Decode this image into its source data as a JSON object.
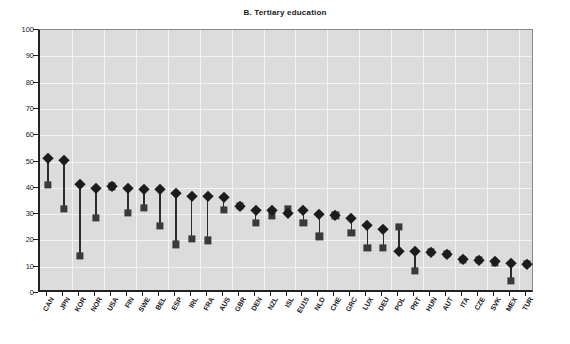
{
  "chart": {
    "title": "B. Tertiary education",
    "type": "dot-plot"
  },
  "chart_data": {
    "type": "scatter",
    "title": "B. Tertiary education",
    "xlabel": "",
    "ylabel": "",
    "ylim": [
      0,
      100
    ],
    "ytick_labels": [
      "0",
      "10",
      "20",
      "30",
      "40",
      "50",
      "60",
      "70",
      "80",
      "90",
      "100"
    ],
    "ytick_values": [
      0,
      10,
      20,
      30,
      40,
      50,
      60,
      70,
      80,
      90,
      100
    ],
    "grid": true,
    "legend_position": "none",
    "categories": [
      "CAN",
      "JPN",
      "KOR",
      "NOR",
      "USA",
      "FIN",
      "SWE",
      "BEL",
      "ESP",
      "IRL",
      "FRA",
      "AUS",
      "GBR",
      "DEN",
      "NZL",
      "ISL",
      "EU15",
      "NLD",
      "CHE",
      "GRC",
      "LUX",
      "DEU",
      "POL",
      "PRT",
      "HUN",
      "AUT",
      "ITA",
      "CZE",
      "SVK",
      "MEX",
      "TUR"
    ],
    "series": [
      {
        "name": "diamond-series",
        "marker": "diamond",
        "values": [
          51.5,
          50.5,
          41.5,
          40.0,
          40.5,
          40.0,
          39.5,
          39.5,
          38.0,
          37.0,
          37.0,
          36.5,
          33.0,
          31.5,
          31.5,
          30.5,
          31.5,
          30.0,
          29.5,
          28.5,
          26.0,
          24.5,
          16.0,
          16.0,
          15.5,
          15.0,
          13.0,
          12.5,
          12.0,
          11.5,
          11.0
        ]
      },
      {
        "name": "square-series",
        "marker": "square",
        "values": [
          41.0,
          32.0,
          14.0,
          28.5,
          40.5,
          30.5,
          32.5,
          25.5,
          18.5,
          20.5,
          20.0,
          31.5,
          33.0,
          26.5,
          29.5,
          32.0,
          26.5,
          21.5,
          29.5,
          23.0,
          17.0,
          17.0,
          25.0,
          8.5,
          15.5,
          15.0,
          12.5,
          12.5,
          11.5,
          4.5,
          11.0
        ]
      }
    ]
  }
}
